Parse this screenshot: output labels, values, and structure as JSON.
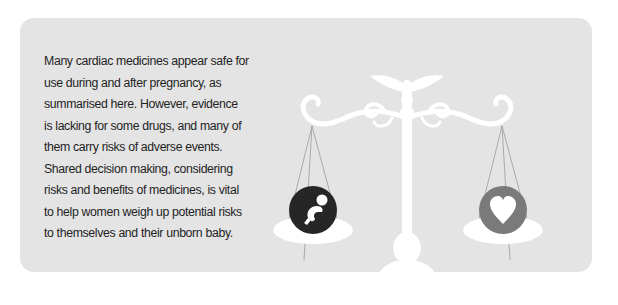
{
  "panel": {
    "background": "#e4e4e4",
    "text": "Many cardiac medicines appear safe for use during and after pregnancy, as summarised here. However, evidence is lacking for some drugs, and many of them carry risks of adverse events. Shared decision making, considering risks and benefits of medicines, is vital to help women weigh up potential risks to themselves and their unborn baby."
  },
  "illustration": {
    "name": "balance-scale-with-caduceus",
    "left_pan_icon": "fetus-icon",
    "right_pan_icon": "heart-icon",
    "colors": {
      "scale": "#ffffff",
      "left_circle": "#262626",
      "right_circle": "#7a7a7a",
      "strings": "#9a9a9a"
    }
  }
}
